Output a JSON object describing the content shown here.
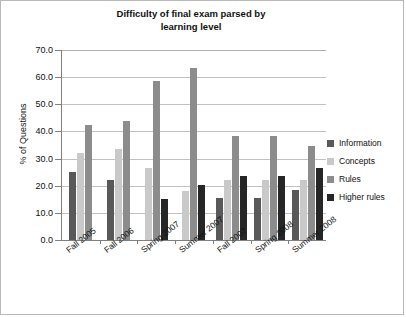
{
  "chart_data": {
    "type": "bar",
    "title": "Difficulty of final exam parsed by learning level",
    "title_line1": "Difficulty of final exam parsed by",
    "title_line2": "learning level",
    "xlabel": "",
    "ylabel": "% of Questions",
    "ylim": [
      0,
      70
    ],
    "ytick_labels": [
      "0.0",
      "10.0",
      "20.0",
      "30.0",
      "40.0",
      "50.0",
      "60.0",
      "70.0"
    ],
    "ytick_values": [
      0,
      10,
      20,
      30,
      40,
      50,
      60,
      70
    ],
    "grid": "horizontal",
    "legend_position": "right",
    "categories": [
      "Fall 2005",
      "Fall 2006",
      "Spring 2007",
      "Summer 2007",
      "Fall 2007",
      "Spring 2008",
      "Summer 2008"
    ],
    "series": [
      {
        "name": "Information",
        "color": "#595959",
        "values": [
          25.0,
          22.0,
          null,
          null,
          15.3,
          15.3,
          18.5
        ]
      },
      {
        "name": "Concepts",
        "color": "#c9c9c9",
        "values": [
          32.0,
          33.5,
          26.5,
          18.0,
          22.0,
          22.0,
          22.0
        ]
      },
      {
        "name": "Rules",
        "color": "#8c8c8c",
        "values": [
          42.5,
          44.0,
          58.5,
          63.5,
          38.5,
          38.5,
          34.5
        ]
      },
      {
        "name": "Higher rules",
        "color": "#262626",
        "values": [
          null,
          null,
          15.0,
          20.3,
          23.5,
          23.5,
          26.5
        ]
      }
    ]
  }
}
